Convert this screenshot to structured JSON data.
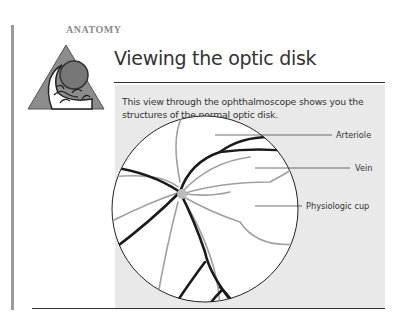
{
  "section": {
    "label": "ANATOMY"
  },
  "header": {
    "title": "Viewing the optic disk",
    "logo_icon": "anatomy-eye-triangle-icon"
  },
  "panel": {
    "intro": "This view through the ophthalmoscope shows you the structures of the normal optic disk.",
    "background": "#e9e9e9"
  },
  "diagram": {
    "labels": [
      {
        "text": "Arteriole"
      },
      {
        "text": "Vein"
      },
      {
        "text": "Physiologic cup"
      }
    ],
    "colors": {
      "vein": "#1a1a1a",
      "arteriole": "#9a9a9a"
    }
  }
}
